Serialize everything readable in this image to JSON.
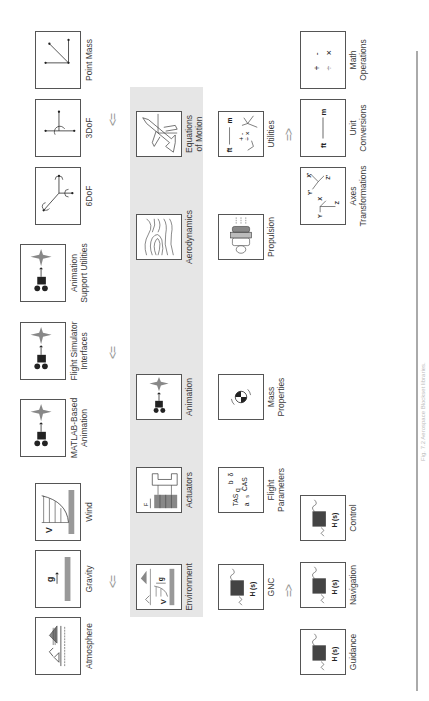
{
  "figure": {
    "caption": "Fig. 7.2   Aerospace Blockset libraries.",
    "rule_color": "#aaaaaa",
    "panel_color": "#e6e6e6"
  },
  "top_row": {
    "environment_group": [
      {
        "label": "Atmosphere",
        "icon": "atmosphere-icon"
      },
      {
        "label": "Gravity",
        "icon": "gravity-icon",
        "glyph": "g"
      },
      {
        "label": "Wind",
        "icon": "wind-icon",
        "glyph": "V"
      }
    ],
    "animation_group": [
      {
        "label": "MATLAB-Based Animation",
        "line1": "MATLAB-Based",
        "line2": "Animation",
        "icon": "animation-icon"
      },
      {
        "label": "Flight Simulator Interfaces",
        "line1": "Flight Simulator",
        "line2": "Interfaces",
        "icon": "animation-icon"
      },
      {
        "label": "Animation Support Utilities",
        "line1": "Animation",
        "line2": "Support Utilities",
        "icon": "animation-icon"
      }
    ],
    "eom_group": [
      {
        "label": "6DoF",
        "icon": "six-dof-icon"
      },
      {
        "label": "3DoF",
        "icon": "three-dof-icon"
      },
      {
        "label": "Point Mass",
        "icon": "point-mass-icon"
      }
    ],
    "arrows": [
      "<=",
      "<=",
      "<="
    ]
  },
  "panel": {
    "row1": [
      {
        "label": "Environment",
        "icon": "environment-icon",
        "glyph_v": "V",
        "glyph_g": "g"
      },
      {
        "label": "Actuators",
        "icon": "actuator-icon",
        "glyph": "F"
      },
      {
        "label": "Animation",
        "icon": "animation-icon"
      },
      {
        "label": "Aerodynamics",
        "icon": "aerodynamics-icon"
      },
      {
        "label": "Equations of Motion",
        "line1": "Equations",
        "line2": "of Motion",
        "icon": "airplane-icon"
      }
    ],
    "row2": [
      {
        "label": "GNC",
        "icon": "transfer-function-icon",
        "glyph": "H (s)"
      },
      {
        "label": "Flight Parameters",
        "line1": "Flight",
        "line2": "Parameters",
        "icon": "flight-parameters-icon",
        "glyphs": [
          "TAS",
          "q",
          "b",
          "δ",
          "a",
          "s",
          "CAS"
        ]
      },
      {
        "label": "Mass Properties",
        "line1": "Mass",
        "line2": "Properties",
        "icon": "center-of-gravity-icon"
      },
      {
        "label": "Propulsion",
        "icon": "engine-icon"
      },
      {
        "label": "Utilities",
        "icon": "utilities-icon",
        "glyphs": [
          "ft",
          "m",
          "+",
          "-",
          "÷",
          "×"
        ]
      }
    ]
  },
  "bottom_row": {
    "gnc_group": [
      {
        "label": "Guidance",
        "icon": "transfer-function-icon",
        "glyph": "H (s)"
      },
      {
        "label": "Navigation",
        "icon": "transfer-function-icon",
        "glyph": "H (s)"
      },
      {
        "label": "Control",
        "icon": "transfer-function-icon",
        "glyph": "H (s)"
      }
    ],
    "utilities_group": [
      {
        "label": "Axes Transformations",
        "line1": "Axes",
        "line2": "Transformations",
        "icon": "axes-icon",
        "glyphs": [
          "Y",
          "X",
          "Z",
          "Y'",
          "X'",
          "Z'"
        ]
      },
      {
        "label": "Unit Conversions",
        "line1": "Unit",
        "line2": "Conversions",
        "icon": "unit-conversion-icon",
        "glyphs": [
          "ft",
          "m"
        ]
      },
      {
        "label": "Math Operations",
        "line1": "Math",
        "line2": "Operations",
        "icon": "math-icon",
        "glyphs": [
          "+",
          "-",
          "÷",
          "×"
        ]
      }
    ],
    "arrows": [
      "=>",
      "=>"
    ]
  }
}
